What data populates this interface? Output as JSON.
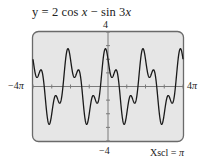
{
  "chart_data": {
    "type": "line",
    "title": "y = 2 cos x − sin 3x",
    "function": "2*cos(x) - sin(3*x)",
    "xlim": [
      -12.566370614359172,
      12.566370614359172
    ],
    "ylim": [
      -4,
      4
    ],
    "x_tick_labels": {
      "min": "−4π",
      "max": "4π"
    },
    "y_tick_labels": {
      "max": "4",
      "min": "−4"
    },
    "xscl": "π",
    "yscl": 1,
    "grid": false,
    "legend": null,
    "annotation": "Xscl = π",
    "colors": {
      "frame_fill": "#e6e6e6",
      "frame_border": "#6a6a6a",
      "curve": "#1a1a1a",
      "axis": "#7a7a7a"
    }
  },
  "labels": {
    "title_prefix": "y = 2 cos ",
    "title_x1": "x",
    "title_mid": " − sin 3",
    "title_x2": "x",
    "y_max": "4",
    "y_min": "−4",
    "x_min_num": "−4",
    "x_max_num": "4",
    "pi": "π",
    "xscl_label": "Xscl = ",
    "xscl_value": "π"
  }
}
